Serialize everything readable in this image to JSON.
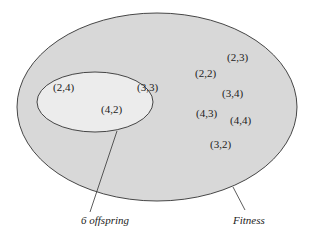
{
  "colors": {
    "outer_fill": "#d8d8d8",
    "inner_fill": "#ececec",
    "stroke": "#333333",
    "background": "#ffffff"
  },
  "outer_set": {
    "label": "Fitness",
    "points": [
      "(2,3)",
      "(2,2)",
      "(3,4)",
      "(4,3)",
      "(4,4)",
      "(3,2)"
    ]
  },
  "inner_set": {
    "label": "6 offspring",
    "points": [
      "(2,4)",
      "(3,3)",
      "(4,2)"
    ]
  }
}
